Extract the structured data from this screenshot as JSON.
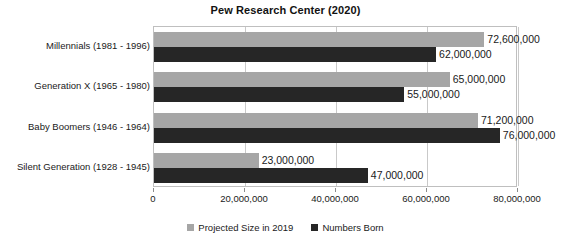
{
  "chart_data": {
    "type": "bar",
    "orientation": "horizontal",
    "title": "Pew Research Center (2020)",
    "xlabel": "",
    "ylabel": "",
    "xlim": [
      0,
      80000000
    ],
    "grid": true,
    "legend_position": "bottom",
    "categories": [
      "Millennials (1981 - 1996)",
      "Generation X (1965 - 1980)",
      "Baby Boomers (1946 - 1964)",
      "Silent Generation (1928 - 1945)"
    ],
    "series": [
      {
        "name": "Projected Size in 2019",
        "color": "#a6a6a6",
        "values": [
          72600000,
          65000000,
          71200000,
          23000000
        ],
        "labels": [
          "72,600,000",
          "65,000,000",
          "71,200,000",
          "23,000,000"
        ]
      },
      {
        "name": "Numbers Born",
        "color": "#262626",
        "values": [
          62000000,
          55000000,
          76000000,
          47000000
        ],
        "labels": [
          "62,000,000",
          "55,000,000",
          "76,000,000",
          "47,000,000"
        ]
      }
    ],
    "xticks": [
      0,
      20000000,
      40000000,
      60000000,
      80000000
    ],
    "xtick_labels": [
      "0",
      "20,000,000",
      "40,000,000",
      "60,000,000",
      "80,000,000"
    ]
  },
  "legend": {
    "items": [
      {
        "label": "Projected Size in 2019",
        "color": "#a6a6a6"
      },
      {
        "label": "Numbers Born",
        "color": "#262626"
      }
    ]
  }
}
